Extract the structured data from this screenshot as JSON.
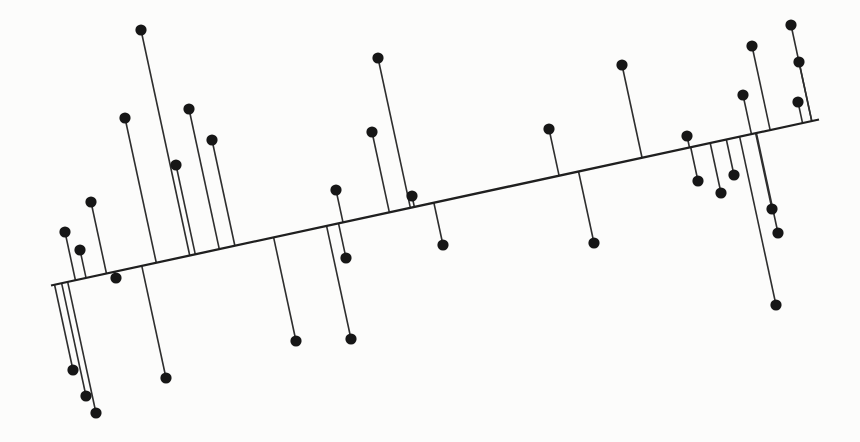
{
  "figure": {
    "kind": "scatterplot-with-fitted-line-and-residuals",
    "width_px": 860,
    "height_px": 442,
    "background_color": "#fcfcfb",
    "has_axes": false,
    "has_text": false
  },
  "chart_data": {
    "type": "scatter",
    "title": "",
    "xlabel": "",
    "ylabel": "",
    "legend": null,
    "grid": false,
    "axes_visible": false,
    "n_points": 36,
    "points_px": [
      [
        141,
        30
      ],
      [
        125,
        118
      ],
      [
        189,
        109
      ],
      [
        212,
        140
      ],
      [
        176,
        165
      ],
      [
        91,
        202
      ],
      [
        336,
        190
      ],
      [
        378,
        58
      ],
      [
        372,
        132
      ],
      [
        412,
        196
      ],
      [
        549,
        129
      ],
      [
        622,
        65
      ],
      [
        687,
        136
      ],
      [
        743,
        95
      ],
      [
        752,
        46
      ],
      [
        791,
        25
      ],
      [
        799,
        62
      ],
      [
        798,
        102
      ],
      [
        698,
        181
      ],
      [
        721,
        193
      ],
      [
        734,
        175
      ],
      [
        772,
        209
      ],
      [
        65,
        232
      ],
      [
        80,
        250
      ],
      [
        116,
        278
      ],
      [
        73,
        370
      ],
      [
        86,
        396
      ],
      [
        96,
        413
      ],
      [
        166,
        378
      ],
      [
        296,
        341
      ],
      [
        351,
        339
      ],
      [
        346,
        258
      ],
      [
        443,
        245
      ],
      [
        594,
        243
      ],
      [
        778,
        233
      ],
      [
        776,
        305
      ]
    ],
    "fit_line_px": {
      "x1": 51,
      "y1": 285.5,
      "x2": 819,
      "y2": 119.5
    },
    "residuals": {
      "shown": true,
      "style": "segment-from-point-to-foot-of-perpendicular-on-fit-line"
    },
    "style": {
      "point_color": "#161616",
      "point_radius": 5.6,
      "fit_line_color": "#1f1f1f",
      "fit_line_width": 2.3,
      "residual_color": "#2e2e2e",
      "residual_width": 1.6
    }
  }
}
